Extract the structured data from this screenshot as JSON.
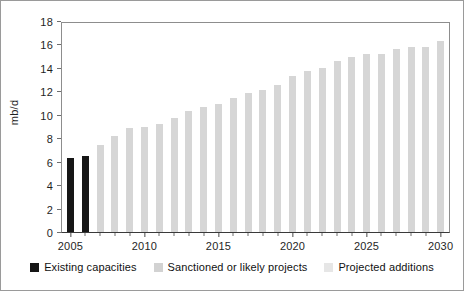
{
  "chart_data": {
    "type": "bar",
    "title": "",
    "xlabel": "",
    "ylabel": "mb/d",
    "ylim": [
      0,
      18
    ],
    "ytick_step": 2,
    "yticks": [
      "0",
      "2",
      "4",
      "6",
      "8",
      "10",
      "12",
      "14",
      "16",
      "18"
    ],
    "grid": false,
    "legend_position": "bottom",
    "xtick_labels": [
      "2005",
      "2010",
      "2015",
      "2020",
      "2025",
      "2030"
    ],
    "categories": [
      "2005",
      "2006",
      "2007",
      "2008",
      "2009",
      "2010",
      "2011",
      "2012",
      "2013",
      "2014",
      "2015",
      "2016",
      "2017",
      "2018",
      "2019",
      "2020",
      "2021",
      "2022",
      "2023",
      "2024",
      "2025",
      "2026",
      "2027",
      "2028",
      "2029",
      "2030"
    ],
    "values": [
      6.3,
      6.5,
      7.4,
      8.2,
      8.9,
      9.0,
      9.2,
      9.7,
      10.3,
      10.7,
      10.9,
      11.4,
      11.9,
      12.1,
      12.5,
      13.3,
      13.7,
      14.0,
      14.6,
      14.9,
      15.2,
      15.2,
      15.6,
      15.8,
      15.8,
      16.3
    ],
    "bar_groups": [
      "existing",
      "existing",
      "projects",
      "projects",
      "projects",
      "projects",
      "projects",
      "projects",
      "projects",
      "projects",
      "projects",
      "projects",
      "projects",
      "projects",
      "projects",
      "projects",
      "projects",
      "projects",
      "projects",
      "projects",
      "projects",
      "projects",
      "projects",
      "projects",
      "projects",
      "projects"
    ],
    "series": [
      {
        "name": "Existing capacities",
        "color": "#161616"
      },
      {
        "name": "Sanctioned or likely projects",
        "color": "#d6d6d6"
      },
      {
        "name": "Projected additions",
        "color": "#e4e4e4"
      }
    ],
    "legend": [
      {
        "label": "Existing capacities",
        "color": "#161616"
      },
      {
        "label": "Sanctioned or likely projects",
        "color": "#d2d2d2"
      },
      {
        "label": "Projected additions",
        "color": "#e6e6e6"
      }
    ]
  }
}
